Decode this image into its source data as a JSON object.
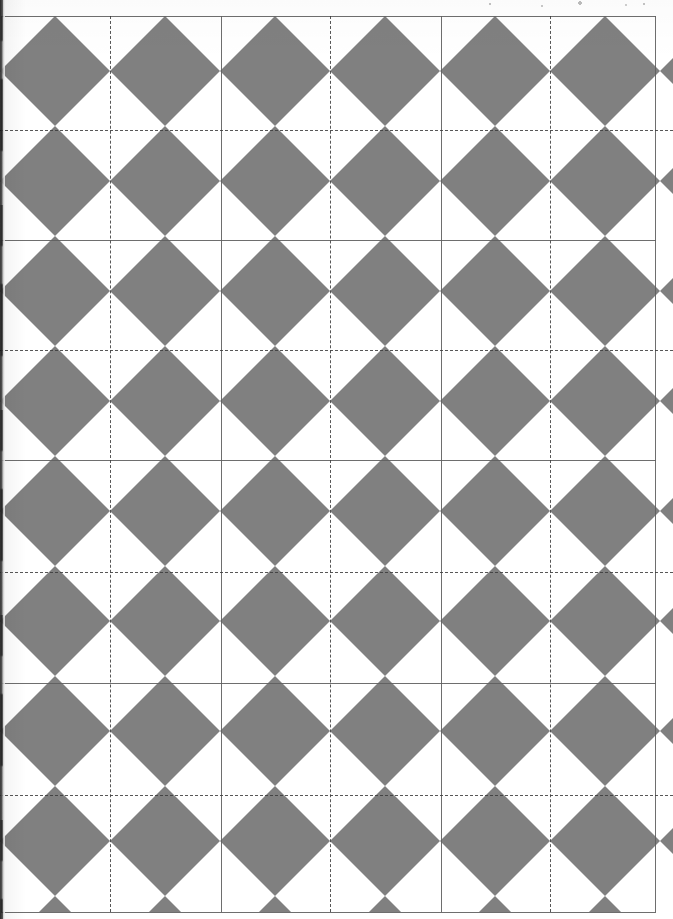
{
  "document": {
    "title": "Quilt Block Layout Diagram",
    "media": "scanned-page",
    "width_px": 673,
    "height_px": 919
  },
  "colors": {
    "shape_fill": "#808080",
    "background": "#ffffff",
    "solid_grid_line": "#5e5e5e",
    "dashed_grid_line": "#3a3a3a",
    "scan_edge": "#1c1c1c"
  },
  "artwork": {
    "name": "diamond-tiling",
    "description": "Repeating grid of gray diamonds forming X / pinwheel quilt blocks on a white ground",
    "shape": "diamond",
    "fill": "#808080",
    "unit_cell_px": 110,
    "columns": 6,
    "rows": 8,
    "origin_x_px": 0,
    "origin_y_px": 16,
    "diamond_half_width_px": 55,
    "diamond_half_height_px": 55
  },
  "grid": {
    "solid": {
      "stroke": "#5e5e5e",
      "style": "solid",
      "spacing_px": 220,
      "vertical_x_px": [
        1,
        221,
        441,
        655
      ],
      "horizontal_y_px": [
        16,
        240,
        460,
        683,
        912
      ]
    },
    "dashed": {
      "stroke": "#3a3a3a",
      "style": "dashed",
      "dash_px": 6,
      "gap_px": 5,
      "spacing_px": 220,
      "vertical_x_px": [
        110,
        330,
        550
      ],
      "horizontal_y_px": [
        130,
        350,
        572,
        795
      ]
    }
  },
  "annotations": {
    "scan_edge_label": "scanner-edge-artifact",
    "noise_label": "scan-speckle"
  }
}
